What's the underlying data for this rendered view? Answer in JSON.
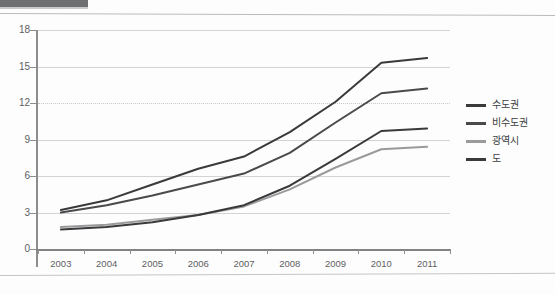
{
  "chart_data": {
    "type": "line",
    "title": "",
    "xlabel": "",
    "ylabel": "",
    "x": [
      "2003",
      "2004",
      "2005",
      "2006",
      "2007",
      "2008",
      "2009",
      "2010",
      "2011"
    ],
    "categories": [
      "2003",
      "2004",
      "2005",
      "2006",
      "2007",
      "2008",
      "2009",
      "2010",
      "2011"
    ],
    "yticks": [
      0,
      3,
      6,
      9,
      12,
      15,
      18
    ],
    "ylim": [
      0,
      18
    ],
    "grid": true,
    "legend_position": "right",
    "series": [
      {
        "name": "수도권",
        "color": "#3a3a3c",
        "values": [
          3.2,
          4.0,
          5.3,
          6.6,
          7.6,
          9.6,
          12.1,
          15.3,
          15.7
        ]
      },
      {
        "name": "비수도권",
        "color": "#4a4a4c",
        "values": [
          3.0,
          3.6,
          4.4,
          5.3,
          6.2,
          7.9,
          10.4,
          12.8,
          13.2
        ]
      },
      {
        "name": "광역시",
        "color": "#9a9a9c",
        "values": [
          1.8,
          2.0,
          2.4,
          2.8,
          3.5,
          4.9,
          6.7,
          8.2,
          8.4
        ]
      },
      {
        "name": "도",
        "color": "#3a3a3c",
        "values": [
          1.6,
          1.8,
          2.2,
          2.8,
          3.6,
          5.2,
          7.4,
          9.7,
          9.9
        ]
      }
    ]
  },
  "legend": {
    "items": [
      {
        "label": "수도권"
      },
      {
        "label": "비수도권"
      },
      {
        "label": "광역시"
      },
      {
        "label": "도"
      }
    ]
  },
  "axis": {
    "y_labels": [
      "18",
      "15",
      "12",
      "9",
      "6",
      "3",
      "0"
    ],
    "x_labels": [
      "2003",
      "2004",
      "2005",
      "2006",
      "2007",
      "2008",
      "2009",
      "2010",
      "2011"
    ]
  }
}
